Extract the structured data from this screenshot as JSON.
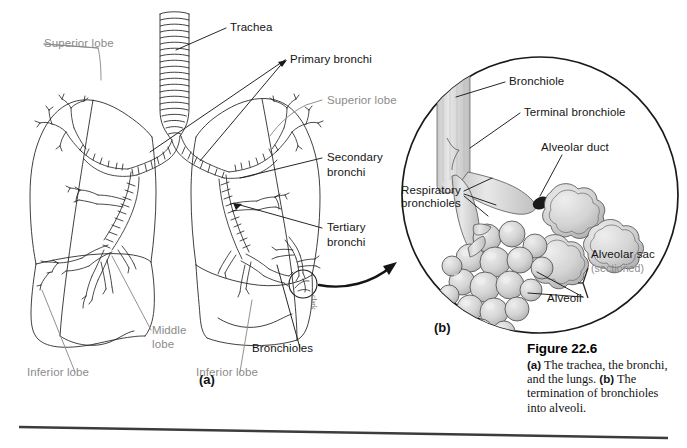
{
  "figure": {
    "caption_title": "Figure 22.6",
    "caption_a": "(a) The trachea, the bronchi, and the lungs.",
    "caption_a_prefix": "(a)",
    "caption_a_text": " The trachea, the bronchi, and the lungs.",
    "caption_b_prefix": "(b)",
    "caption_b_text": " The termination of bronchioles into alveoli.",
    "artist_signature": "clark"
  },
  "panel_a": {
    "tag": "(a)",
    "labels": {
      "trachea": "Trachea",
      "primary_bronchi": "Primary bronchi",
      "superior_lobe_left": "Superior lobe",
      "superior_lobe_right": "Superior lobe",
      "secondary_bronchi": "Secondary\nbronchi",
      "secondary_bronchi_line1": "Secondary",
      "secondary_bronchi_line2": "bronchi",
      "tertiary_bronchi_line1": "Tertiary",
      "tertiary_bronchi_line2": "bronchi",
      "middle_lobe_line1": "Middle",
      "middle_lobe_line2": "lobe",
      "inferior_lobe_left": "Inferior lobe",
      "inferior_lobe_right": "Inferior lobe",
      "bronchioles": "Bronchioles"
    }
  },
  "panel_b": {
    "tag": "(b)",
    "labels": {
      "bronchiole": "Bronchiole",
      "terminal_bronchiole": "Terminal bronchiole",
      "alveolar_duct": "Alveolar duct",
      "respiratory_bronchioles_line1": "Respiratory",
      "respiratory_bronchioles_line2": "bronchioles",
      "alveolar_sac": "Alveolar sac",
      "alveolar_sac_sub": "(sectioned)",
      "alveoli": "Alveoli"
    }
  },
  "colors": {
    "ink": "#141414",
    "gray_label": "#8b8b8b",
    "tissue_fill": "#d8d8d8",
    "tissue_stroke": "#4a4a4a",
    "background": "#ffffff",
    "rule": "#3c3c3c"
  }
}
